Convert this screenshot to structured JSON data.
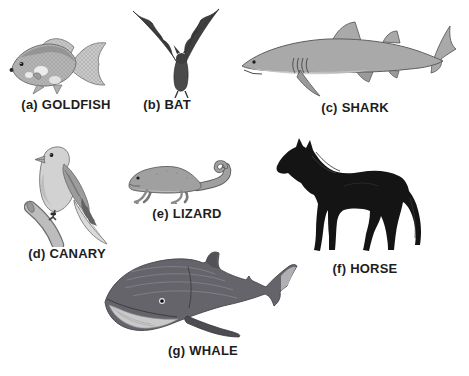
{
  "figure": {
    "items": [
      {
        "letter": "(a)",
        "name": "GOLDFISH"
      },
      {
        "letter": "(b)",
        "name": "BAT"
      },
      {
        "letter": "(c)",
        "name": "SHARK"
      },
      {
        "letter": "(d)",
        "name": "CANARY"
      },
      {
        "letter": "(e)",
        "name": "LIZARD"
      },
      {
        "letter": "(f)",
        "name": "HORSE"
      },
      {
        "letter": "(g)",
        "name": "WHALE"
      }
    ],
    "palette": {
      "background": "#ffffff",
      "label_text": "#1d1d1d",
      "goldfish": "#b5b5b5",
      "goldfish_fins": "#c9c9c9",
      "bat": "#3f3f3f",
      "shark": "#a9a9a9",
      "shark_belly": "#c6c6c6",
      "canary": "#d2d2d2",
      "canary_wing": "#9c9c9c",
      "branch": "#bdbdbd",
      "lizard": "#a0a0a0",
      "horse": "#141414",
      "whale": "#64646a",
      "whale_jaw": "#c9c9c9"
    }
  }
}
